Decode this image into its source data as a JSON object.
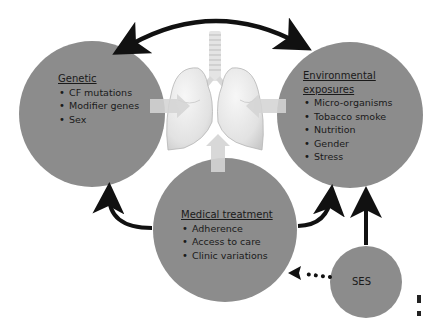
{
  "diagram": {
    "center_image": "lungs-illustration",
    "nodes": {
      "genetic": {
        "title": "Genetic",
        "items": [
          "CF mutations",
          "Modifier genes",
          "Sex"
        ]
      },
      "environmental": {
        "title_line1": "Environmental",
        "title_line2": "exposures",
        "items": [
          "Micro-organisms",
          "Tobacco smoke",
          "Nutrition",
          "Gender",
          "Stress"
        ]
      },
      "medical": {
        "title": "Medical treatment",
        "items": [
          "Adherence",
          "Access to care",
          "Clinic variations"
        ]
      },
      "ses": {
        "label": "SES"
      }
    },
    "edges": [
      {
        "from": "genetic",
        "to": "environmental",
        "style": "solid",
        "direction": "bidirectional"
      },
      {
        "from": "medical",
        "to": "genetic",
        "style": "solid",
        "direction": "forward"
      },
      {
        "from": "medical",
        "to": "environmental",
        "style": "solid",
        "direction": "forward"
      },
      {
        "from": "ses",
        "to": "environmental",
        "style": "solid",
        "direction": "forward"
      },
      {
        "from": "ses",
        "to": "medical",
        "style": "dotted",
        "direction": "forward"
      },
      {
        "from": "genetic",
        "to": "lungs",
        "style": "block-arrow"
      },
      {
        "from": "environmental",
        "to": "lungs",
        "style": "block-arrow"
      },
      {
        "from": "medical",
        "to": "lungs",
        "style": "block-arrow"
      }
    ],
    "colors": {
      "circle_fill": "#8c8c8c",
      "arrow": "#111111",
      "block_arrow": "#d6d6d6",
      "lung": "#e8e8e8"
    }
  }
}
